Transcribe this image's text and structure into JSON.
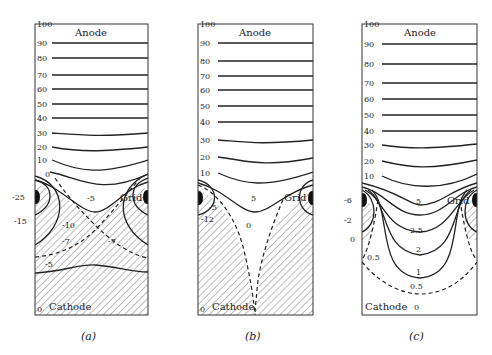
{
  "figure": {
    "panels": [
      {
        "id": "a",
        "caption": "(a)",
        "top_label": "Anode",
        "bottom_label": "Cathode",
        "grid_label": "Grid",
        "axis_ticks": [
          "100",
          "90",
          "80",
          "70",
          "60",
          "50",
          "40",
          "30",
          "20",
          "10",
          "0"
        ],
        "left_side_labels": [
          "-25",
          "-15"
        ],
        "contour_labels": [
          "-5",
          "-10",
          "-7",
          "-7",
          "-5",
          "0"
        ],
        "bottom_corner_label": "0"
      },
      {
        "id": "b",
        "caption": "(b)",
        "top_label": "Anode",
        "bottom_label": "Cathode",
        "grid_label": "Grid",
        "axis_ticks": [
          "100",
          "90",
          "80",
          "70",
          "60",
          "50",
          "40",
          "30",
          "20",
          "10"
        ],
        "contour_labels": [
          "5",
          "-5",
          "-12",
          "0"
        ],
        "bottom_corner_label": "0"
      },
      {
        "id": "c",
        "caption": "(c)",
        "top_label": "Anode",
        "bottom_label": "Cathode",
        "grid_label": "Grid",
        "axis_ticks": [
          "100",
          "90",
          "80",
          "70",
          "60",
          "50",
          "40",
          "30",
          "20",
          "10"
        ],
        "left_side_labels": [
          "-6",
          "-2",
          "0"
        ],
        "contour_labels": [
          "5",
          "2.5",
          "2",
          "1",
          "0.5",
          "0.5"
        ],
        "bottom_value_label": "0"
      }
    ]
  }
}
